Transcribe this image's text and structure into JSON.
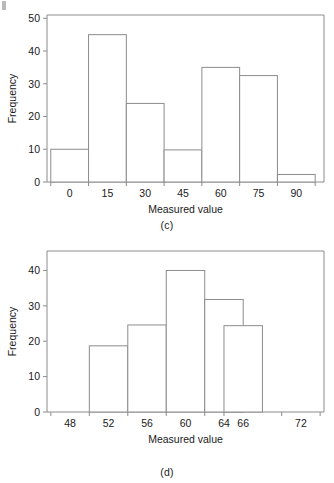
{
  "page": {
    "background": "#ffffff",
    "line_color": "#8c8c8c",
    "text_color": "#1a1a1a"
  },
  "figures": [
    {
      "id": "figure-c",
      "caption": "(c)"
    },
    {
      "id": "figure-d",
      "caption": "(d)"
    }
  ],
  "chart_data": [
    {
      "type": "bar",
      "subtype": "histogram",
      "title": "",
      "caption": "(c)",
      "xlabel": "Measured value",
      "ylabel": "Frequency",
      "categories": [
        "0",
        "15",
        "30",
        "45",
        "60",
        "75",
        "90"
      ],
      "bin_centers": [
        0,
        15,
        30,
        45,
        60,
        75,
        90
      ],
      "bin_width": 15,
      "values": [
        10,
        45,
        24,
        9.8,
        35,
        32.5,
        2.3
      ],
      "xtick_labels": [
        "0",
        "15",
        "30",
        "45",
        "60",
        "75",
        "90"
      ],
      "ytick_labels": [
        "0",
        "10",
        "20",
        "30",
        "40",
        "50"
      ],
      "yticks": [
        0,
        10,
        20,
        30,
        40,
        50
      ],
      "ylim": [
        0,
        51
      ],
      "xlim": [
        -9,
        101
      ],
      "grid": false,
      "legend": false
    },
    {
      "type": "bar",
      "subtype": "histogram",
      "title": "",
      "caption": "(d)",
      "xlabel": "Measured value",
      "ylabel": "Frequency",
      "categories": [
        "48",
        "52",
        "56",
        "60",
        "64",
        "66",
        "72"
      ],
      "bin_centers": [
        48,
        52,
        56,
        60,
        64,
        66,
        72
      ],
      "bin_width": 4,
      "values": [
        0,
        18.7,
        24.6,
        40,
        31.8,
        24.4,
        0
      ],
      "xtick_labels": [
        "48",
        "52",
        "56",
        "60",
        "64",
        "66",
        "72"
      ],
      "ytick_labels": [
        "0",
        "10",
        "20",
        "30",
        "40"
      ],
      "yticks": [
        0,
        10,
        20,
        30,
        40
      ],
      "ylim": [
        0,
        45.5
      ],
      "xlim": [
        45.6,
        74.4
      ],
      "grid": false,
      "legend": false
    }
  ]
}
